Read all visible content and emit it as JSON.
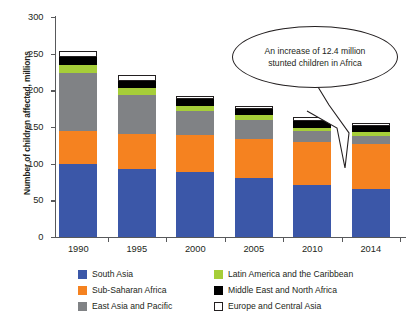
{
  "chart_data": {
    "type": "bar",
    "subtype": "stacked-vertical",
    "title": "",
    "xlabel": "",
    "ylabel": "Number of children affected, millions",
    "ylim": [
      0,
      300
    ],
    "yticks": [
      0,
      50,
      100,
      150,
      200,
      250,
      300
    ],
    "grid": false,
    "legend_position": "bottom",
    "categories": [
      "1990",
      "1995",
      "2000",
      "2005",
      "2010",
      "2014"
    ],
    "series": [
      {
        "name": "South Asia",
        "color": "#3b57a8",
        "values": [
          100,
          93,
          88,
          80,
          71,
          65
        ]
      },
      {
        "name": "Sub-Saharan Africa",
        "color": "#f58220",
        "values": [
          44,
          48,
          51,
          54,
          58,
          62
        ]
      },
      {
        "name": "East Asia and Pacific",
        "color": "#808285",
        "values": [
          80,
          53,
          33,
          26,
          15,
          11
        ]
      },
      {
        "name": "Latin America and the Caribbean",
        "color": "#a6ce39",
        "values": [
          10,
          9,
          7,
          6,
          5,
          5
        ]
      },
      {
        "name": "Middle East and North Africa",
        "color": "#000000",
        "values": [
          11,
          10,
          9,
          8,
          9,
          8
        ]
      },
      {
        "name": "Europe and Central Asia",
        "color": "#ffffff",
        "values": [
          8,
          8,
          4,
          4,
          5,
          4
        ]
      }
    ],
    "totals": [
      253,
      221,
      192,
      178,
      163,
      155
    ],
    "annotations": [
      {
        "text": "An increase of 12.4 million stunted children in Africa",
        "lines": [
          "An increase of 12.4 million",
          "stunted children in Africa"
        ],
        "shape": "ellipse",
        "points_to": "2014"
      }
    ]
  },
  "axes": {
    "y_title": "Number of children affected, millions",
    "y_tick_labels": [
      "0",
      "50",
      "100",
      "150",
      "200",
      "250",
      "300"
    ],
    "x_tick_labels": [
      "1990",
      "1995",
      "2000",
      "2005",
      "2010",
      "2014"
    ]
  },
  "legend": {
    "entries": [
      {
        "label": "South Asia",
        "color": "#3b57a8",
        "bordered": false
      },
      {
        "label": "Latin America and the Caribbean",
        "color": "#a6ce39",
        "bordered": false
      },
      {
        "label": "Sub-Saharan Africa",
        "color": "#f58220",
        "bordered": false
      },
      {
        "label": "Middle East and North Africa",
        "color": "#000000",
        "bordered": false
      },
      {
        "label": "East Asia and Pacific",
        "color": "#808285",
        "bordered": false
      },
      {
        "label": "Europe and Central Asia",
        "color": "#ffffff",
        "bordered": true
      }
    ]
  },
  "callout": {
    "line1": "An increase of 12.4 million",
    "line2": "stunted children in Africa"
  }
}
